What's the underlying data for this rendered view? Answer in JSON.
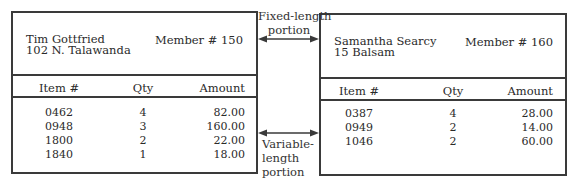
{
  "records": [
    {
      "name": "Tim Gottfried",
      "address": "102 N. Talawanda",
      "member": "Member # 150",
      "columns": [
        "Item #",
        "Qty",
        "Amount"
      ],
      "rows": [
        {
          "item": "0462",
          "qty": "4",
          "amount": "82.00"
        },
        {
          "item": "0948",
          "qty": "3",
          "amount": "160.00"
        },
        {
          "item": "1800",
          "qty": "2",
          "amount": "22.00"
        },
        {
          "item": "1840",
          "qty": "1",
          "amount": "18.00"
        }
      ]
    },
    {
      "name": "Samantha Searcy",
      "address": "15 Balsam",
      "member": "Member # 160",
      "columns": [
        "Item #",
        "Qty",
        "Amount"
      ],
      "rows": [
        {
          "item": "0387",
          "qty": "4",
          "amount": "28.00"
        },
        {
          "item": "0949",
          "qty": "2",
          "amount": "14.00"
        },
        {
          "item": "1046",
          "qty": "2",
          "amount": "60.00"
        }
      ]
    }
  ],
  "labels": {
    "fixed_line1": "Fixed-length",
    "fixed_line2": "portion",
    "variable_line1": "Variable-",
    "variable_line2": "length",
    "variable_line3": "portion"
  },
  "icons": {
    "fixed_arrow": "double-arrow-icon",
    "variable_arrow": "double-arrow-icon"
  },
  "colors": {
    "border": "#3a3a3a",
    "text": "#2a2a2a"
  }
}
